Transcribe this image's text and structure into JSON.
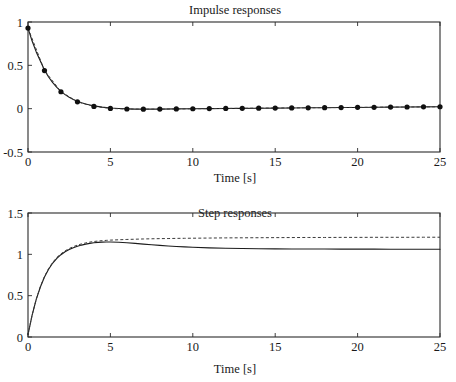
{
  "figure": {
    "background": "#ffffff",
    "ink_color": "#1a1a1a",
    "width": 456,
    "height": 382
  },
  "chart_data": [
    {
      "id": "impulse",
      "type": "line",
      "title": "Impulse responses",
      "xlabel": "Time [s]",
      "ylabel": "",
      "xlim": [
        0,
        25
      ],
      "ylim": [
        -0.5,
        1
      ],
      "xticks": [
        0,
        5,
        10,
        15,
        20,
        25
      ],
      "xticklabels": [
        "0",
        "5",
        "10",
        "15",
        "20",
        "25"
      ],
      "yticks": [
        -0.5,
        0,
        0.5,
        1
      ],
      "yticklabels": [
        "-0.5",
        "0",
        "0.5",
        "1"
      ],
      "grid": false,
      "legend": "none",
      "box": true,
      "series": [
        {
          "name": "model impulse response",
          "style": "solid",
          "color": "#1c1c1c",
          "markers": "none",
          "x": [
            0,
            0.25,
            0.5,
            0.75,
            1,
            1.25,
            1.5,
            1.75,
            2,
            2.25,
            2.5,
            2.75,
            3,
            3.25,
            3.5,
            3.75,
            4,
            4.5,
            5,
            5.5,
            6,
            6.5,
            7,
            7.5,
            8,
            9,
            10,
            11,
            12,
            13,
            14,
            15,
            16,
            17,
            18,
            19,
            20,
            21,
            22,
            23,
            24,
            25
          ],
          "y": [
            0.93,
            0.78,
            0.655,
            0.55,
            0.445,
            0.365,
            0.3,
            0.245,
            0.2,
            0.162,
            0.131,
            0.106,
            0.085,
            0.068,
            0.054,
            0.043,
            0.033,
            0.018,
            0.008,
            0.002,
            -0.002,
            -0.005,
            -0.006,
            -0.006,
            -0.005,
            -0.003,
            -0.001,
            0.001,
            0.002,
            0.004,
            0.005,
            0.007,
            0.008,
            0.01,
            0.011,
            0.013,
            0.014,
            0.016,
            0.017,
            0.019,
            0.02,
            0.022
          ]
        },
        {
          "name": "estimated impulse response",
          "style": "dashed",
          "color": "#3a3a3a",
          "markers": "dot",
          "marker_size": 2.6,
          "x": [
            0,
            1,
            2,
            3,
            4,
            5,
            6,
            7,
            8,
            9,
            10,
            11,
            12,
            13,
            14,
            15,
            16,
            17,
            18,
            19,
            20,
            21,
            22,
            23,
            24,
            25
          ],
          "y": [
            0.93,
            0.44,
            0.195,
            0.079,
            0.026,
            0.003,
            -0.004,
            -0.006,
            -0.005,
            -0.003,
            -0.001,
            0.001,
            0.003,
            0.004,
            0.006,
            0.007,
            0.009,
            0.01,
            0.012,
            0.013,
            0.015,
            0.016,
            0.018,
            0.019,
            0.021,
            0.022
          ]
        }
      ]
    },
    {
      "id": "step",
      "type": "line",
      "title": "Step responses",
      "xlabel": "Time [s]",
      "ylabel": "",
      "xlim": [
        0,
        25
      ],
      "ylim": [
        0,
        1.5
      ],
      "xticks": [
        0,
        5,
        10,
        15,
        20,
        25
      ],
      "xticklabels": [
        "0",
        "5",
        "10",
        "15",
        "20",
        "25"
      ],
      "yticks": [
        0,
        0.5,
        1,
        1.5
      ],
      "yticklabels": [
        "0",
        "0.5",
        "1",
        "1.5"
      ],
      "grid": false,
      "legend": "none",
      "box": true,
      "series": [
        {
          "name": "model step response",
          "style": "solid",
          "color": "#1c1c1c",
          "markers": "none",
          "x": [
            0,
            0.25,
            0.5,
            0.75,
            1,
            1.25,
            1.5,
            1.75,
            2,
            2.25,
            2.5,
            2.75,
            3,
            3.25,
            3.5,
            3.75,
            4,
            4.25,
            4.5,
            4.75,
            5,
            5.5,
            6,
            6.5,
            7,
            7.5,
            8,
            8.5,
            9,
            9.5,
            10,
            11,
            12,
            13,
            14,
            15,
            16,
            17,
            18,
            19,
            20,
            21,
            22,
            23,
            24,
            25
          ],
          "y": [
            0.03,
            0.265,
            0.455,
            0.605,
            0.725,
            0.82,
            0.895,
            0.952,
            0.996,
            1.031,
            1.058,
            1.08,
            1.098,
            1.112,
            1.124,
            1.133,
            1.14,
            1.145,
            1.148,
            1.149,
            1.149,
            1.146,
            1.14,
            1.132,
            1.124,
            1.116,
            1.108,
            1.101,
            1.095,
            1.09,
            1.086,
            1.078,
            1.073,
            1.07,
            1.068,
            1.066,
            1.065,
            1.064,
            1.064,
            1.063,
            1.063,
            1.063,
            1.062,
            1.062,
            1.062,
            1.062
          ]
        },
        {
          "name": "estimated step response",
          "style": "dashed",
          "color": "#3a3a3a",
          "markers": "none",
          "x": [
            0,
            0.25,
            0.5,
            0.75,
            1,
            1.25,
            1.5,
            1.75,
            2,
            2.25,
            2.5,
            2.75,
            3,
            3.25,
            3.5,
            3.75,
            4,
            4.25,
            4.5,
            4.75,
            5,
            5.5,
            6,
            6.5,
            7,
            7.5,
            8,
            8.5,
            9,
            9.5,
            10,
            11,
            12,
            13,
            14,
            15,
            16,
            17,
            18,
            19,
            20,
            21,
            22,
            23,
            24,
            25
          ],
          "y": [
            0.03,
            0.265,
            0.458,
            0.61,
            0.732,
            0.828,
            0.903,
            0.962,
            1.006,
            1.042,
            1.07,
            1.093,
            1.112,
            1.126,
            1.138,
            1.148,
            1.155,
            1.161,
            1.165,
            1.169,
            1.172,
            1.176,
            1.18,
            1.183,
            1.186,
            1.188,
            1.19,
            1.191,
            1.193,
            1.194,
            1.195,
            1.197,
            1.199,
            1.2,
            1.201,
            1.202,
            1.203,
            1.204,
            1.204,
            1.205,
            1.205,
            1.206,
            1.206,
            1.206,
            1.207,
            1.207
          ]
        }
      ]
    }
  ],
  "layout": {
    "impulse_plot_box": {
      "left": 28,
      "top": 22,
      "right": 440,
      "bottom": 152
    },
    "step_plot_box": {
      "left": 28,
      "top": 213,
      "right": 440,
      "bottom": 337
    }
  }
}
